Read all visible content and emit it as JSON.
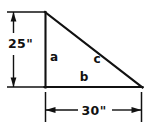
{
  "figure": {
    "shape": "right triangle",
    "stroke_color": "#111111",
    "background_color": "#ffffff",
    "labels": {
      "height_dimension": "25\"",
      "base_dimension": "30\"",
      "vertical_leg": "a",
      "base_leg": "b",
      "hypotenuse": "c"
    },
    "geometry": {
      "apex": [
        45,
        12
      ],
      "bottom_left": [
        45,
        87
      ],
      "bottom_right": [
        142,
        87
      ],
      "vertical_dimension_line_x": 13,
      "vertical_dimension_top_y": 12,
      "vertical_dimension_bottom_y": 87,
      "horizontal_dimension_line_y": 110,
      "horizontal_dimension_left_x": 45,
      "horizontal_dimension_right_x": 141
    }
  }
}
